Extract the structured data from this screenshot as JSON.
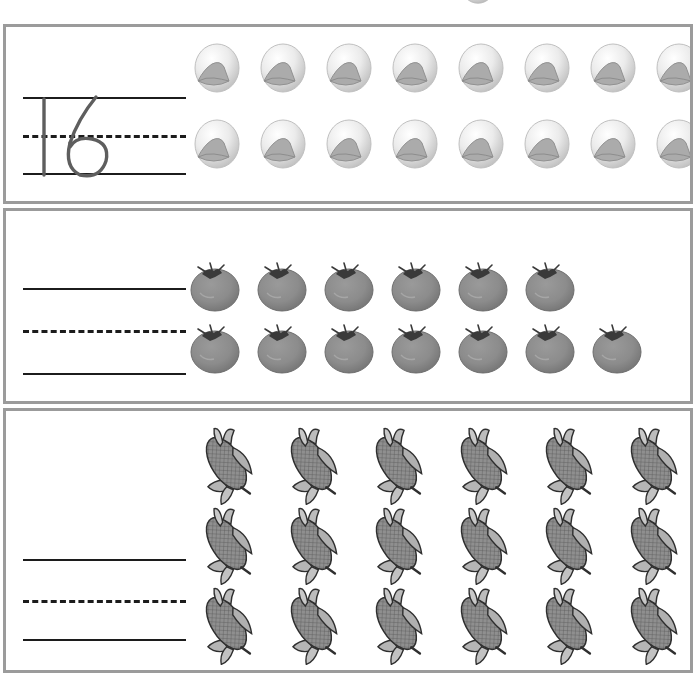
{
  "worksheet": {
    "title": "Number tracing and counting worksheet",
    "background_color": "#ffffff",
    "panel_border_color": "#9b9b9b",
    "line_color": "#1c1c1c"
  },
  "top_bleed": {
    "icon": "mushroom-icon",
    "description": "partially cut-off mushroom from the panel above"
  },
  "panels": [
    {
      "id": "panel-mushrooms",
      "item_name": "mushroom",
      "icon": "mushroom-icon",
      "answer": "16",
      "answer_filled": true,
      "answer_style": "traced-handwriting",
      "total_count": 16,
      "rows": [
        8,
        8
      ],
      "guide_lines": [
        "solid",
        "dashed",
        "solid"
      ]
    },
    {
      "id": "panel-tomatoes",
      "item_name": "tomato",
      "icon": "tomato-icon",
      "answer": "",
      "answer_filled": false,
      "answer_style": "blank",
      "total_count": 13,
      "rows": [
        6,
        7
      ],
      "guide_lines": [
        "solid",
        "dashed",
        "solid"
      ]
    },
    {
      "id": "panel-corn",
      "item_name": "corn",
      "icon": "corn-icon",
      "answer": "",
      "answer_filled": false,
      "answer_style": "blank",
      "total_count": 19,
      "rows": [
        6,
        7,
        6
      ],
      "guide_lines": [
        "solid",
        "dashed",
        "solid"
      ]
    }
  ]
}
